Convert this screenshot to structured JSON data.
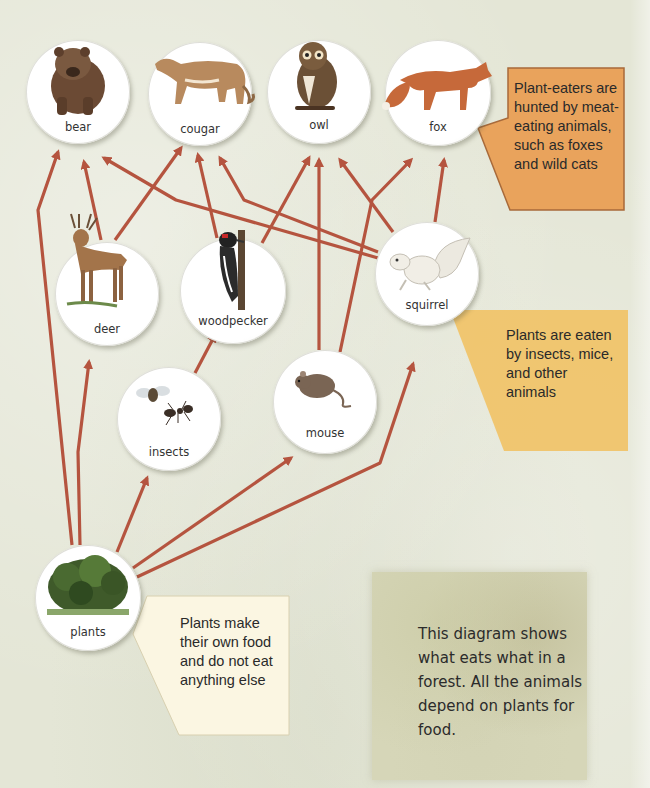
{
  "diagram": {
    "type": "food-web",
    "arrow_color": "#b5543f",
    "nodes": {
      "bear": {
        "label": "bear",
        "icon": "bear-icon"
      },
      "cougar": {
        "label": "cougar",
        "icon": "cougar-icon"
      },
      "owl": {
        "label": "owl",
        "icon": "owl-icon"
      },
      "fox": {
        "label": "fox",
        "icon": "fox-icon"
      },
      "deer": {
        "label": "deer",
        "icon": "deer-icon"
      },
      "woodpecker": {
        "label": "woodpecker",
        "icon": "woodpecker-icon"
      },
      "squirrel": {
        "label": "squirrel",
        "icon": "squirrel-icon"
      },
      "insects": {
        "label": "insects",
        "icon": "insects-icon"
      },
      "mouse": {
        "label": "mouse",
        "icon": "mouse-icon"
      },
      "plants": {
        "label": "plants",
        "icon": "plants-icon"
      }
    },
    "edges": [
      {
        "from": "plants",
        "to": "bear"
      },
      {
        "from": "plants",
        "to": "deer"
      },
      {
        "from": "plants",
        "to": "insects"
      },
      {
        "from": "plants",
        "to": "mouse"
      },
      {
        "from": "plants",
        "to": "squirrel"
      },
      {
        "from": "deer",
        "to": "bear"
      },
      {
        "from": "deer",
        "to": "cougar"
      },
      {
        "from": "insects",
        "to": "woodpecker"
      },
      {
        "from": "woodpecker",
        "to": "cougar"
      },
      {
        "from": "woodpecker",
        "to": "owl"
      },
      {
        "from": "mouse",
        "to": "owl"
      },
      {
        "from": "mouse",
        "to": "fox"
      },
      {
        "from": "squirrel",
        "to": "bear"
      },
      {
        "from": "squirrel",
        "to": "cougar"
      },
      {
        "from": "squirrel",
        "to": "owl"
      },
      {
        "from": "squirrel",
        "to": "fox"
      }
    ],
    "callouts": {
      "meat_eaters": {
        "text": "Plant-eaters are hunted by meat-eating animals, such as foxes and wild cats",
        "color": "#e9a35c"
      },
      "plant_eaters": {
        "text": "Plants are eaten by insects, mice, and other animals",
        "color": "#f0c46a"
      },
      "producers": {
        "text": "Plants make their own food and do not eat anything else",
        "color": "#fbf6e2"
      }
    },
    "summary": {
      "text": "This diagram shows what eats what in a forest. All the animals depend on plants for food."
    }
  }
}
